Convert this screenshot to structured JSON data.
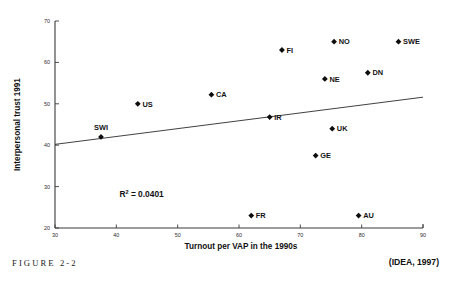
{
  "figure": {
    "caption": "FIGURE 2-2",
    "source_note": "(IDEA, 1997)"
  },
  "chart_data": {
    "type": "scatter",
    "title": "",
    "xlabel": "Turnout per VAP in the 1990s",
    "ylabel": "Interpersonal trust 1991",
    "xlim": [
      30,
      90
    ],
    "ylim": [
      20,
      70
    ],
    "xticks": [
      30,
      40,
      50,
      60,
      70,
      80,
      90
    ],
    "yticks": [
      20,
      30,
      40,
      50,
      60,
      70
    ],
    "grid": false,
    "legend": "none",
    "annotations": [
      {
        "text": "R2 = 0.0401",
        "display_base": "R",
        "display_sup": "2",
        "display_rest": " = 0.0401",
        "x": 40.5,
        "y": 27.5
      }
    ],
    "points": [
      {
        "label": "SWI",
        "x": 37.5,
        "y": 42.0,
        "label_pos": "above"
      },
      {
        "label": "US",
        "x": 43.5,
        "y": 50.0,
        "label_pos": "right"
      },
      {
        "label": "CA",
        "x": 55.5,
        "y": 52.2,
        "label_pos": "right"
      },
      {
        "label": "IR",
        "x": 65.0,
        "y": 46.8,
        "label_pos": "right"
      },
      {
        "label": "FI",
        "x": 67.0,
        "y": 63.0,
        "label_pos": "right"
      },
      {
        "label": "GE",
        "x": 72.5,
        "y": 37.5,
        "label_pos": "right"
      },
      {
        "label": "NE",
        "x": 74.0,
        "y": 56.0,
        "label_pos": "right"
      },
      {
        "label": "UK",
        "x": 75.2,
        "y": 44.0,
        "label_pos": "right"
      },
      {
        "label": "NO",
        "x": 75.5,
        "y": 65.0,
        "label_pos": "right"
      },
      {
        "label": "AU",
        "x": 79.5,
        "y": 23.0,
        "label_pos": "right"
      },
      {
        "label": "DN",
        "x": 81.0,
        "y": 57.5,
        "label_pos": "right"
      },
      {
        "label": "SWE",
        "x": 86.0,
        "y": 65.0,
        "label_pos": "right"
      },
      {
        "label": "FR",
        "x": 62.0,
        "y": 23.0,
        "label_pos": "right"
      }
    ],
    "trendline": {
      "x0": 30,
      "y0": 40.2,
      "x1": 90,
      "y1": 51.6,
      "r_squared": 0.0401
    },
    "colors": {
      "marker": "#0d0d0d",
      "axis": "#3a3a3a",
      "trendline": "#2b2b2b",
      "text": "#101010",
      "background": "#ffffff"
    }
  }
}
